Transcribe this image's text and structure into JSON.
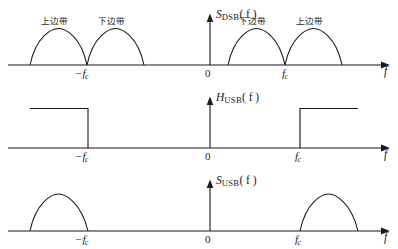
{
  "figure": {
    "type": "signal-spectrum-diagram",
    "axis_variable": "f",
    "origin_label": "0",
    "neg_carrier_label": "−f",
    "neg_carrier_sub": "c",
    "pos_carrier_label": "f",
    "pos_carrier_sub": "c",
    "upper_sideband_cn": "上边带",
    "lower_sideband_cn": "下边带",
    "line_color": "#1a1a1a",
    "background": "#ffffff"
  },
  "panels": [
    {
      "id": "dsb",
      "ordinate_symbol": "S",
      "ordinate_subscript": "DSB",
      "ordinate_arg": "( f )",
      "ordinate_full": "S_DSB(f)",
      "description": "Double sideband spectrum with four half-arch lobes",
      "lobes": [
        {
          "name": "upper-sideband-neg",
          "caption": "上边带",
          "from": -2,
          "to": -1,
          "peak": 1
        },
        {
          "name": "lower-sideband-neg",
          "caption": "下边带",
          "from": -1,
          "to": 0,
          "peak": 1
        },
        {
          "name": "lower-sideband-pos",
          "caption": "下边带",
          "from": 0,
          "to": 1,
          "peak": 1
        },
        {
          "name": "upper-sideband-pos",
          "caption": "上边带",
          "from": 1,
          "to": 2,
          "peak": 1
        }
      ],
      "ticks": [
        "−f_c",
        "0",
        "f_c"
      ]
    },
    {
      "id": "husb",
      "ordinate_symbol": "H",
      "ordinate_subscript": "USB",
      "ordinate_arg": "( f )",
      "ordinate_full": "H_USB(f)",
      "description": "Upper sideband filter transfer function, ideal rectangular passbands beyond ±f_c",
      "passbands": [
        {
          "name": "passband-negative",
          "from": -2.05,
          "to": -1,
          "level": 1
        },
        {
          "name": "passband-positive",
          "from": 1,
          "to": 2.05,
          "level": 1
        }
      ],
      "ticks": [
        "−f_c",
        "0",
        "f_c"
      ]
    },
    {
      "id": "susb",
      "ordinate_symbol": "S",
      "ordinate_subscript": "USB",
      "ordinate_arg": "( f )",
      "ordinate_full": "S_USB(f)",
      "description": "Resulting upper sideband spectrum, only outer lobes remain",
      "lobes": [
        {
          "name": "upper-sideband-neg",
          "caption": "",
          "from": -2,
          "to": -1,
          "peak": 1
        },
        {
          "name": "upper-sideband-pos",
          "caption": "",
          "from": 1,
          "to": 2,
          "peak": 1
        }
      ],
      "ticks": [
        "−f_c",
        "0",
        "f_c"
      ]
    }
  ]
}
